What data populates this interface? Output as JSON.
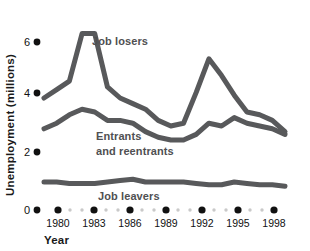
{
  "chart_data": {
    "type": "line",
    "title": "",
    "xlabel": "Year",
    "ylabel": "Unemployment (millions)",
    "ylim": [
      0,
      6.8
    ],
    "xlim": [
      1979,
      1998
    ],
    "yticks": [
      0,
      2,
      4,
      6
    ],
    "ytick_labels": [
      "0",
      "2",
      "4",
      "6"
    ],
    "xticks": [
      1980,
      1983,
      1986,
      1989,
      1992,
      1995,
      1998
    ],
    "xtick_labels": [
      "1980",
      "1983",
      "1986",
      "1989",
      "1992",
      "1995",
      "1998"
    ],
    "grid": false,
    "legend": "inline-annotations",
    "x": [
      1979,
      1980,
      1981,
      1982,
      1983,
      1984,
      1985,
      1986,
      1987,
      1988,
      1989,
      1990,
      1991,
      1992,
      1993,
      1994,
      1995,
      1996,
      1997,
      1998
    ],
    "series": [
      {
        "name": "Job losers",
        "color": "#58595b",
        "values": [
          4.0,
          4.3,
          4.6,
          6.3,
          6.3,
          4.4,
          4.0,
          3.8,
          3.6,
          3.2,
          3.0,
          3.1,
          4.2,
          5.4,
          4.8,
          4.1,
          3.5,
          3.4,
          3.2,
          2.8
        ]
      },
      {
        "name": "Entrants and reentrants",
        "color": "#58595b",
        "values": [
          2.9,
          3.1,
          3.4,
          3.6,
          3.5,
          3.2,
          3.2,
          3.1,
          2.8,
          2.6,
          2.5,
          2.5,
          2.7,
          3.1,
          3.0,
          3.3,
          3.1,
          3.0,
          2.9,
          2.7
        ]
      },
      {
        "name": "Job leavers",
        "color": "#58595b",
        "values": [
          1.0,
          1.0,
          0.95,
          0.95,
          0.95,
          1.0,
          1.05,
          1.1,
          1.0,
          1.0,
          1.0,
          1.0,
          0.95,
          0.9,
          0.9,
          1.0,
          0.95,
          0.9,
          0.9,
          0.85
        ]
      }
    ],
    "annotations": [
      {
        "name": "job-losers-label",
        "text": "Job losers"
      },
      {
        "name": "entrants-label-line1",
        "text": "Entrants"
      },
      {
        "name": "entrants-label-line2",
        "text": "and reentrants"
      },
      {
        "name": "job-leavers-label",
        "text": "Job leavers"
      }
    ]
  },
  "axis": {
    "y_title": "Unemployment (millions)",
    "x_title": "Year",
    "y_labels": [
      "6",
      "4",
      "2",
      "0"
    ],
    "x_labels": [
      "1980",
      "1983",
      "1986",
      "1989",
      "1992",
      "1995",
      "1998"
    ]
  },
  "labels": {
    "job_losers": "Job losers",
    "entrants_1": "Entrants",
    "entrants_2": "and reentrants",
    "job_leavers": "Job leavers"
  },
  "colors": {
    "line": "#58595b",
    "label": "#4f5052",
    "axis_dot": "#111111",
    "minor_dot": "#c9c9c9",
    "background": "#ffffff"
  }
}
